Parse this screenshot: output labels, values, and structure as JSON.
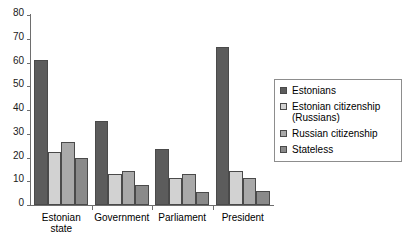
{
  "chart_data": {
    "type": "bar",
    "title": "",
    "xlabel": "",
    "ylabel": "",
    "ylim": [
      0,
      80
    ],
    "yticks": [
      0,
      10,
      20,
      30,
      40,
      50,
      60,
      70,
      80
    ],
    "grid": false,
    "legend_position": "right",
    "categories": [
      "Estonian\nstate",
      "Government",
      "Parliament",
      "President"
    ],
    "series": [
      {
        "name": "Estonians",
        "color": "#5c5c5c",
        "values": [
          61,
          35.5,
          23.5,
          66.5
        ]
      },
      {
        "name": "Estonian citizenship (Russians)",
        "color": "#d2d2d2",
        "values": [
          22.5,
          13,
          11.5,
          14.5
        ]
      },
      {
        "name": "Russian citizenship",
        "color": "#a9a9a9",
        "values": [
          26.5,
          14.5,
          13,
          11.5
        ]
      },
      {
        "name": "Stateless",
        "color": "#8a8a8a",
        "values": [
          20,
          8.5,
          5.5,
          6
        ]
      }
    ]
  }
}
